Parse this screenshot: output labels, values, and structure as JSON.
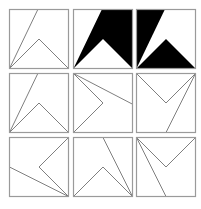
{
  "puzzle": {
    "description": "3x3 grid of square panels with line/chevron figures",
    "colors": {
      "border": "#9a9a9a",
      "line": "#7f7f7f",
      "fill": "#000000",
      "background": "#ffffff"
    },
    "grid": {
      "columns_x": [
        9,
        73,
        136
      ],
      "rows_y": [
        9,
        73,
        137
      ],
      "cell_size": 59
    },
    "cells": [
      {
        "row": 0,
        "col": 0,
        "name": "cell-r1c1",
        "type": "outline",
        "line": [
          [
            0,
            100
          ],
          [
            48,
            0
          ]
        ],
        "chevron": [
          [
            0,
            100
          ],
          [
            50,
            50
          ],
          [
            100,
            100
          ]
        ]
      },
      {
        "row": 0,
        "col": 1,
        "name": "cell-r1c2",
        "type": "filled",
        "fill_polygons": [
          [
            [
              48,
              0
            ],
            [
              100,
              0
            ],
            [
              100,
              100
            ],
            [
              50,
              50
            ],
            [
              0,
              100
            ]
          ]
        ]
      },
      {
        "row": 0,
        "col": 2,
        "name": "cell-r1c3",
        "type": "filled",
        "fill_polygons": [
          [
            [
              0,
              0
            ],
            [
              48,
              0
            ],
            [
              0,
              100
            ]
          ],
          [
            [
              0,
              100
            ],
            [
              50,
              50
            ],
            [
              100,
              100
            ]
          ]
        ]
      },
      {
        "row": 1,
        "col": 0,
        "name": "cell-r2c1",
        "type": "outline",
        "line": [
          [
            0,
            100
          ],
          [
            48,
            0
          ]
        ],
        "chevron": [
          [
            0,
            100
          ],
          [
            50,
            50
          ],
          [
            100,
            100
          ]
        ]
      },
      {
        "row": 1,
        "col": 1,
        "name": "cell-r2c2",
        "type": "outline",
        "line": [
          [
            0,
            0
          ],
          [
            100,
            52
          ]
        ],
        "chevron": [
          [
            0,
            0
          ],
          [
            50,
            50
          ],
          [
            0,
            100
          ]
        ]
      },
      {
        "row": 1,
        "col": 2,
        "name": "cell-r2c3",
        "type": "outline",
        "line": [
          [
            100,
            0
          ],
          [
            50,
            100
          ]
        ],
        "chevron": [
          [
            100,
            0
          ],
          [
            50,
            50
          ],
          [
            0,
            0
          ]
        ]
      },
      {
        "row": 2,
        "col": 0,
        "name": "cell-r3c1",
        "type": "outline",
        "line": [
          [
            100,
            100
          ],
          [
            0,
            50
          ]
        ],
        "chevron": [
          [
            100,
            100
          ],
          [
            50,
            50
          ],
          [
            100,
            0
          ]
        ]
      },
      {
        "row": 2,
        "col": 1,
        "name": "cell-r3c2",
        "type": "outline",
        "line": [
          [
            100,
            100
          ],
          [
            50,
            0
          ]
        ],
        "chevron": [
          [
            100,
            100
          ],
          [
            50,
            50
          ],
          [
            0,
            100
          ]
        ]
      },
      {
        "row": 2,
        "col": 2,
        "name": "cell-r3c3",
        "type": "outline",
        "line": [
          [
            0,
            0
          ],
          [
            50,
            100
          ]
        ],
        "chevron": [
          [
            0,
            0
          ],
          [
            50,
            50
          ],
          [
            100,
            0
          ]
        ]
      }
    ]
  }
}
